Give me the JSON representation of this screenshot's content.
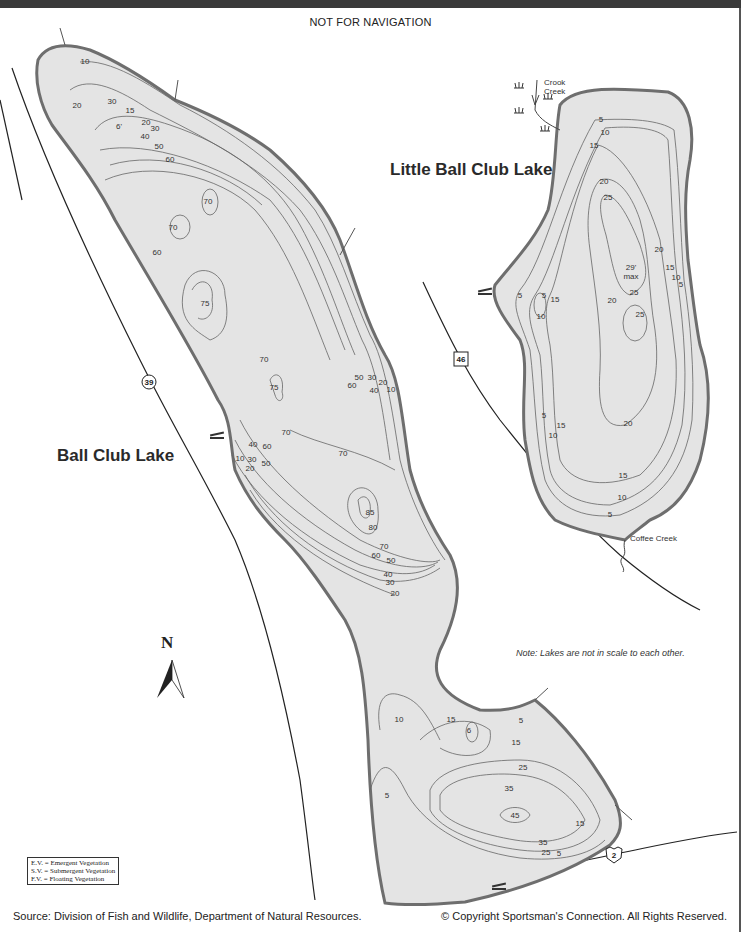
{
  "header": {
    "note": "NOT FOR NAVIGATION"
  },
  "lakes": {
    "big": {
      "name": "Ball Club Lake",
      "depths": [
        {
          "v": "10",
          "x": 85,
          "y": 64
        },
        {
          "v": "20",
          "x": 77,
          "y": 108
        },
        {
          "v": "30",
          "x": 112,
          "y": 104
        },
        {
          "v": "15",
          "x": 130,
          "y": 113
        },
        {
          "v": "6'",
          "x": 119,
          "y": 129
        },
        {
          "v": "20",
          "x": 146,
          "y": 125
        },
        {
          "v": "30",
          "x": 155,
          "y": 131
        },
        {
          "v": "40",
          "x": 145,
          "y": 139
        },
        {
          "v": "50",
          "x": 159,
          "y": 149
        },
        {
          "v": "60",
          "x": 170,
          "y": 162
        },
        {
          "v": "70",
          "x": 208,
          "y": 204
        },
        {
          "v": "70",
          "x": 173,
          "y": 230
        },
        {
          "v": "60",
          "x": 157,
          "y": 255
        },
        {
          "v": "75",
          "x": 205,
          "y": 306
        },
        {
          "v": "70",
          "x": 264,
          "y": 362
        },
        {
          "v": "75",
          "x": 274,
          "y": 390
        },
        {
          "v": "50",
          "x": 359,
          "y": 380
        },
        {
          "v": "30",
          "x": 372,
          "y": 380
        },
        {
          "v": "20",
          "x": 383,
          "y": 385
        },
        {
          "v": "60",
          "x": 352,
          "y": 388
        },
        {
          "v": "40",
          "x": 374,
          "y": 393
        },
        {
          "v": "10",
          "x": 391,
          "y": 392
        },
        {
          "v": "70",
          "x": 286,
          "y": 435
        },
        {
          "v": "40",
          "x": 253,
          "y": 447
        },
        {
          "v": "60",
          "x": 267,
          "y": 449
        },
        {
          "v": "10",
          "x": 240,
          "y": 461
        },
        {
          "v": "30",
          "x": 252,
          "y": 462
        },
        {
          "v": "50",
          "x": 266,
          "y": 466
        },
        {
          "v": "20",
          "x": 250,
          "y": 471
        },
        {
          "v": "70",
          "x": 343,
          "y": 456
        },
        {
          "v": "85",
          "x": 370,
          "y": 515
        },
        {
          "v": "80",
          "x": 373,
          "y": 530
        },
        {
          "v": "70",
          "x": 384,
          "y": 549
        },
        {
          "v": "60",
          "x": 376,
          "y": 558
        },
        {
          "v": "50",
          "x": 391,
          "y": 563
        },
        {
          "v": "40",
          "x": 388,
          "y": 577
        },
        {
          "v": "30",
          "x": 390,
          "y": 585
        },
        {
          "v": "20",
          "x": 395,
          "y": 596
        },
        {
          "v": "10",
          "x": 399,
          "y": 722
        },
        {
          "v": "15",
          "x": 451,
          "y": 722
        },
        {
          "v": "6",
          "x": 469,
          "y": 733
        },
        {
          "v": "5",
          "x": 521,
          "y": 723
        },
        {
          "v": "15",
          "x": 516,
          "y": 745
        },
        {
          "v": "25",
          "x": 523,
          "y": 770
        },
        {
          "v": "35",
          "x": 509,
          "y": 791
        },
        {
          "v": "45",
          "x": 515,
          "y": 818
        },
        {
          "v": "5",
          "x": 387,
          "y": 798
        },
        {
          "v": "15",
          "x": 580,
          "y": 826
        },
        {
          "v": "35",
          "x": 543,
          "y": 845
        },
        {
          "v": "25",
          "x": 546,
          "y": 855
        },
        {
          "v": "5",
          "x": 559,
          "y": 856
        }
      ]
    },
    "small": {
      "name": "Little Ball Club Lake",
      "depths": [
        {
          "v": "5",
          "x": 601,
          "y": 122
        },
        {
          "v": "10",
          "x": 605,
          "y": 135
        },
        {
          "v": "15",
          "x": 594,
          "y": 148
        },
        {
          "v": "20",
          "x": 604,
          "y": 184
        },
        {
          "v": "25",
          "x": 608,
          "y": 200
        },
        {
          "v": "20",
          "x": 659,
          "y": 252
        },
        {
          "v": "29'",
          "x": 631,
          "y": 270
        },
        {
          "v": "max",
          "x": 631,
          "y": 279
        },
        {
          "v": "15",
          "x": 670,
          "y": 270
        },
        {
          "v": "10",
          "x": 676,
          "y": 280
        },
        {
          "v": "5",
          "x": 681,
          "y": 287
        },
        {
          "v": "5",
          "x": 520,
          "y": 298
        },
        {
          "v": "5",
          "x": 544,
          "y": 298
        },
        {
          "v": "15",
          "x": 555,
          "y": 302
        },
        {
          "v": "20",
          "x": 612,
          "y": 303
        },
        {
          "v": "25",
          "x": 634,
          "y": 295
        },
        {
          "v": "10",
          "x": 541,
          "y": 319
        },
        {
          "v": "25",
          "x": 640,
          "y": 317
        },
        {
          "v": "5",
          "x": 544,
          "y": 418
        },
        {
          "v": "15",
          "x": 561,
          "y": 428
        },
        {
          "v": "10",
          "x": 553,
          "y": 438
        },
        {
          "v": "20",
          "x": 628,
          "y": 426
        },
        {
          "v": "15",
          "x": 623,
          "y": 478
        },
        {
          "v": "10",
          "x": 622,
          "y": 500
        },
        {
          "v": "5",
          "x": 610,
          "y": 517
        }
      ]
    }
  },
  "creeks": {
    "crook": [
      "Crook",
      "Creek"
    ],
    "coffee": "Coffee Creek"
  },
  "highways": [
    {
      "label": "39",
      "shape": "circle",
      "x": 149,
      "y": 382
    },
    {
      "label": "46",
      "shape": "square",
      "x": 461,
      "y": 359
    },
    {
      "label": "2",
      "shape": "shield",
      "x": 614,
      "y": 855
    }
  ],
  "compass": {
    "label": "N"
  },
  "scale_note": "Note: Lakes are not in scale to each other.",
  "legend": [
    "E.V. = Emergent Vegetation",
    "S.V. = Submergent Vegetation",
    "F.V. = Floating Vegetation"
  ],
  "footer": {
    "source": "Source: Division of Fish and Wildlife, Department of Natural Resources.",
    "copyright": "© Copyright Sportsman's Connection.  All Rights Reserved."
  },
  "colors": {
    "water": "#e4e4e4",
    "shore": "#6e6e6e",
    "contour": "#666666",
    "road": "#222222"
  }
}
